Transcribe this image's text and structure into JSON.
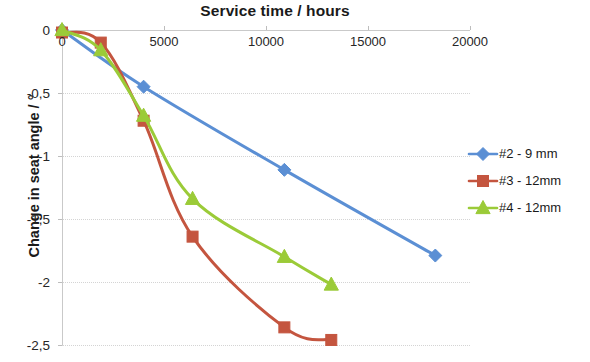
{
  "chart_data": {
    "type": "line",
    "title": "Service time / hours",
    "xlabel": "Service time / hours",
    "ylabel": "Change in seat angle / °",
    "xlim": [
      0,
      20000
    ],
    "ylim": [
      -2.5,
      0
    ],
    "grid": true,
    "legend_position": "right",
    "x_axis_position": "top",
    "decimal_separator": ",",
    "x_ticks": [
      0,
      5000,
      10000,
      15000,
      20000
    ],
    "x_tick_labels": [
      "0",
      "5000",
      "10000",
      "15000",
      "20000"
    ],
    "y_ticks": [
      0,
      -0.5,
      -1,
      -1.5,
      -2,
      -2.5
    ],
    "y_tick_labels": [
      "0",
      "-0,5",
      "-1",
      "-1,5",
      "-2",
      "-2,5"
    ],
    "series": [
      {
        "name": "#2 - 9 mm",
        "color": "#5B8FD4",
        "marker": "diamond",
        "x": [
          0,
          4000,
          10900,
          18300
        ],
        "values": [
          0,
          -0.45,
          -1.11,
          -1.79
        ]
      },
      {
        "name": "#3 - 12mm",
        "color": "#C4553F",
        "marker": "square",
        "x": [
          0,
          1900,
          4000,
          6400,
          10900,
          13200
        ],
        "values": [
          -0.02,
          -0.1,
          -0.72,
          -1.64,
          -2.36,
          -2.46
        ]
      },
      {
        "name": "#4 - 12mm",
        "color": "#9BCB38",
        "marker": "triangle",
        "x": [
          0,
          1900,
          4000,
          6400,
          10900,
          13200
        ],
        "values": [
          0,
          -0.16,
          -0.68,
          -1.34,
          -1.8,
          -2.02
        ]
      }
    ]
  },
  "legend": {
    "items": [
      {
        "label": "#2 - 9 mm"
      },
      {
        "label": "#3 - 12mm"
      },
      {
        "label": "#4 - 12mm"
      }
    ]
  },
  "axes": {
    "title": "Service time / hours",
    "y_title": "Change in seat angle / °"
  }
}
